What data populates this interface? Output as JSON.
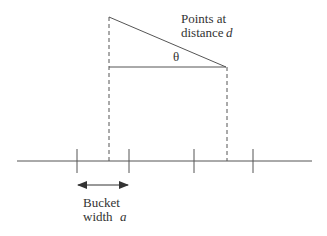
{
  "diagram": {
    "labels": {
      "points_line1": "Points at",
      "points_line2": "distance",
      "distance_var": "d",
      "angle": "θ",
      "bucket_line1": "Bucket",
      "bucket_line2": "width",
      "width_var": "a"
    },
    "colors": {
      "stroke": "#555555",
      "text": "#333333",
      "background": "#ffffff"
    },
    "axis": {
      "x1": 17,
      "x2": 312,
      "y": 161
    },
    "bucket_ticks_x": [
      77,
      129,
      194,
      253
    ],
    "projection_x": [
      109,
      227
    ],
    "triangle": {
      "top_left": [
        109,
        17
      ],
      "right": [
        226,
        67
      ],
      "base_left": [
        109,
        67
      ]
    },
    "bucket_arrow": {
      "x1": 77,
      "x2": 129,
      "y": 185
    }
  }
}
